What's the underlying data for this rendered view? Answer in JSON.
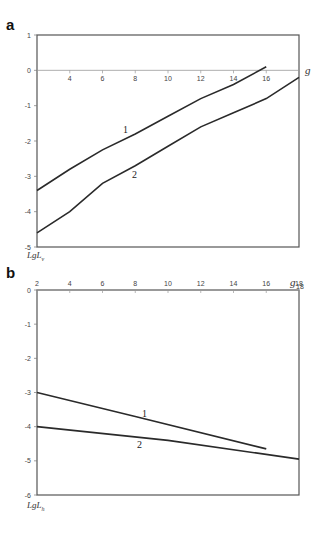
{
  "chart_data": [
    {
      "panel": "a",
      "type": "line",
      "title": "",
      "xlabel": "g",
      "ylabel": "LgL_v",
      "xlim": [
        2,
        18
      ],
      "ylim": [
        -5,
        1
      ],
      "x_ticks": [
        4,
        6,
        8,
        10,
        12,
        14,
        16
      ],
      "y_ticks": [
        1,
        0,
        -1,
        -2,
        -3,
        -4,
        -5
      ],
      "grid": false,
      "legend": "inline curve labels",
      "series": [
        {
          "name": "1",
          "x": [
            2,
            4,
            6,
            8,
            10,
            12,
            14,
            16
          ],
          "values": [
            -3.4,
            -2.8,
            -2.25,
            -1.8,
            -1.3,
            -0.8,
            -0.4,
            0.1
          ]
        },
        {
          "name": "2",
          "x": [
            2,
            4,
            6,
            8,
            10,
            12,
            14,
            16,
            18
          ],
          "values": [
            -4.6,
            -4.0,
            -3.2,
            -2.7,
            -2.15,
            -1.6,
            -1.2,
            -0.8,
            -0.2
          ]
        }
      ]
    },
    {
      "panel": "b",
      "type": "line",
      "title": "",
      "xlabel": "g",
      "ylabel": "LgL_h",
      "xlim": [
        2,
        18
      ],
      "ylim": [
        -6,
        0
      ],
      "x_ticks": [
        2,
        4,
        6,
        8,
        10,
        12,
        14,
        16,
        18
      ],
      "y_ticks": [
        0,
        -1,
        -2,
        -3,
        -4,
        -5,
        -6
      ],
      "grid": false,
      "legend": "inline curve labels",
      "series": [
        {
          "name": "1",
          "x": [
            2,
            8,
            16
          ],
          "values": [
            -3.0,
            -3.7,
            -4.65
          ]
        },
        {
          "name": "2",
          "x": [
            2,
            10,
            18
          ],
          "values": [
            -4.0,
            -4.4,
            -4.95
          ]
        }
      ]
    }
  ],
  "labels": {
    "panel_a": "a",
    "panel_b": "b",
    "a_xaxis": "g",
    "b_xaxis": "g",
    "a_yaxis_main": "LgL",
    "a_yaxis_sub": "v",
    "b_yaxis_main": "LgL",
    "b_yaxis_sub": "h",
    "curve1": "1",
    "curve2": "2"
  }
}
